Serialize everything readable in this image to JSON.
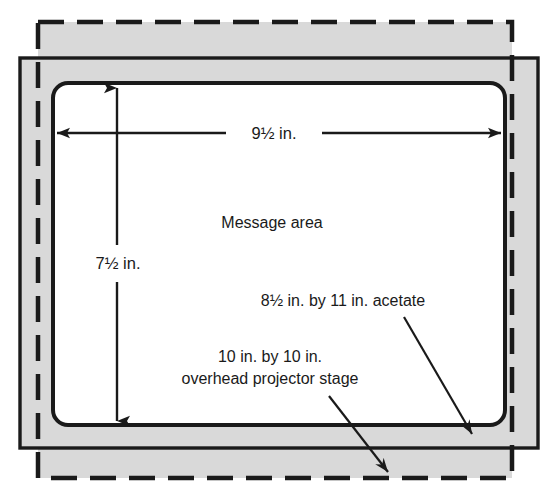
{
  "diagram": {
    "colors": {
      "stroke": "#1a1a1a",
      "gray_fill": "#d9d9d9",
      "white_fill": "#ffffff",
      "background": "#ffffff"
    },
    "shapes": {
      "acetate": {
        "name": "8.5 in. by 11 in. acetate",
        "style": "dashed",
        "x": 38,
        "y": 22,
        "width": 474,
        "height": 456
      },
      "stage": {
        "name": "10 in. by 10 in. overhead projector stage",
        "style": "solid",
        "x": 20,
        "y": 58,
        "width": 518,
        "height": 390
      },
      "message_area": {
        "name": "Message area",
        "style": "solid-rounded",
        "x": 53,
        "y": 83,
        "width": 452,
        "height": 342,
        "corner_radius": 15
      }
    },
    "dimensions": {
      "width_label": "9½ in.",
      "height_label": "7½ in."
    },
    "labels": {
      "message_area": "Message area",
      "acetate": "8½ in. by 11 in. acetate",
      "stage_line1": "10 in. by 10 in.",
      "stage_line2": "overhead projector stage"
    }
  }
}
